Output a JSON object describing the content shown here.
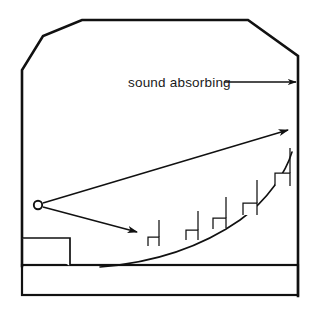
{
  "figure": {
    "type": "architectural-section-diagram",
    "background_color": "#ffffff",
    "ink_color": "#111111"
  },
  "annotation": {
    "label": "sound absorbing",
    "label_x": 128,
    "label_y": 87,
    "leader": {
      "from_x": 224,
      "from_y": 82,
      "to_x": 298,
      "to_y": 82,
      "arrow_direction": "right",
      "points_to": "rear-wall"
    }
  },
  "room": {
    "name": "hall-enclosure",
    "outline_points": "22,265 22,70 43,36 82,20 248,20 298,56 298,295",
    "left_wall_x": 22,
    "right_wall_x": 298,
    "ceiling_y": 20,
    "floor_y": 265
  },
  "ground": {
    "name": "earth-fill",
    "x": 22,
    "y": 265,
    "width": 276,
    "height": 30,
    "pattern": "stipple-dots"
  },
  "stage": {
    "name": "stage-platform",
    "x": 22,
    "y": 238,
    "width": 48,
    "height": 27
  },
  "source": {
    "name": "sound-source",
    "cx": 38,
    "cy": 205,
    "r": 4.2,
    "symbol": "open-circle"
  },
  "rays": [
    {
      "name": "direct-ray-upper",
      "from_x": 43,
      "from_y": 203,
      "to_x": 290,
      "to_y": 130,
      "arrowhead": true
    },
    {
      "name": "direct-ray-lower",
      "from_x": 43,
      "from_y": 207,
      "to_x": 139,
      "to_y": 233,
      "arrowhead": true
    }
  ],
  "rake": {
    "name": "seating-rake-curve",
    "path": "M 100,267 C 150,263 200,248 240,220 C 268,200 286,172 292,152"
  },
  "seats": [
    {
      "name": "seat-row-1",
      "x": 148,
      "y": 237,
      "w": 11,
      "h": 9,
      "back_h": 17
    },
    {
      "name": "seat-row-2",
      "x": 186,
      "y": 230,
      "w": 12,
      "h": 10,
      "back_h": 19
    },
    {
      "name": "seat-row-3",
      "x": 213,
      "y": 218,
      "w": 13,
      "h": 11,
      "back_h": 21
    },
    {
      "name": "seat-row-4",
      "x": 243,
      "y": 203,
      "w": 14,
      "h": 12,
      "back_h": 23
    },
    {
      "name": "seat-row-5",
      "x": 275,
      "y": 173,
      "w": 15,
      "h": 13,
      "back_h": 25
    }
  ]
}
